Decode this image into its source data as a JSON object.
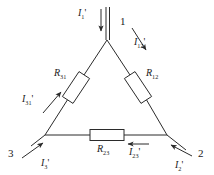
{
  "diagram": {
    "type": "circuit-schematic",
    "stroke_color": "#2b2b2b",
    "background_color": "#ffffff",
    "text_color": "#1a1a1a"
  },
  "nodes": [
    {
      "id": "node-1",
      "label": "1",
      "x": 120,
      "y": 16
    },
    {
      "id": "node-2",
      "label": "2",
      "x": 198,
      "y": 148
    },
    {
      "id": "node-3",
      "label": "3",
      "x": 8,
      "y": 148
    }
  ],
  "vertices": {
    "top": {
      "x": 107,
      "y": 40
    },
    "bottom_left": {
      "x": 45,
      "y": 135
    },
    "bottom_right": {
      "x": 167,
      "y": 135
    }
  },
  "resistors": [
    {
      "id": "resistor-r31",
      "label": "R",
      "sub": "31",
      "label_x": 54,
      "label_y": 68,
      "branch": "3-1"
    },
    {
      "id": "resistor-r12",
      "label": "R",
      "sub": "12",
      "label_x": 146,
      "label_y": 68,
      "branch": "1-2"
    },
    {
      "id": "resistor-r23",
      "label": "R",
      "sub": "23",
      "label_x": 97,
      "label_y": 144,
      "branch": "2-3"
    }
  ],
  "currents": [
    {
      "id": "current-i1-line",
      "symbol": "I",
      "sub": "1",
      "prime": "'",
      "x": 78,
      "y": 8,
      "kind": "line",
      "direction": "into-node-1"
    },
    {
      "id": "current-i2-line",
      "symbol": "I",
      "sub": "2",
      "prime": "'",
      "x": 175,
      "y": 160,
      "kind": "line",
      "direction": "into-node-2"
    },
    {
      "id": "current-i3-line",
      "symbol": "I",
      "sub": "3",
      "prime": "'",
      "x": 41,
      "y": 158,
      "kind": "line",
      "direction": "into-node-3"
    },
    {
      "id": "current-i12-phase",
      "symbol": "I",
      "sub": "12",
      "prime": "'",
      "x": 134,
      "y": 37,
      "kind": "phase",
      "direction": "node-1-to-node-2"
    },
    {
      "id": "current-i23-phase",
      "symbol": "I",
      "sub": "23",
      "prime": "'",
      "x": 129,
      "y": 147,
      "kind": "phase",
      "direction": "node-2-to-node-3"
    },
    {
      "id": "current-i31-phase",
      "symbol": "I",
      "sub": "31",
      "prime": "'",
      "x": 22,
      "y": 94,
      "kind": "phase",
      "direction": "node-3-to-node-1"
    }
  ]
}
